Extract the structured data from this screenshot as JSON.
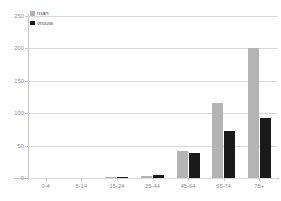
{
  "legend": {
    "position": "top-left",
    "entries": [
      {
        "label": "man",
        "color": "#b4b4b4"
      },
      {
        "label": "vrouw",
        "color": "#1a1a1a"
      }
    ]
  },
  "axes": {
    "y_ticks": [
      "0",
      "50",
      "100",
      "150",
      "200",
      "250"
    ],
    "x_ticks": [
      "0-4",
      "5-14",
      "15-24",
      "25-44",
      "45-64",
      "65-74",
      "75+"
    ]
  },
  "chart_data": {
    "type": "bar",
    "title": "",
    "subtitle": "",
    "xlabel": "",
    "ylabel": "",
    "categories": [
      "0-4",
      "5-14",
      "15-24",
      "25-44",
      "45-64",
      "65-74",
      "75+"
    ],
    "series": [
      {
        "name": "man",
        "color": "#b4b4b4",
        "values": [
          0,
          0,
          1,
          3,
          42,
          115,
          200
        ]
      },
      {
        "name": "vrouw",
        "color": "#1a1a1a",
        "values": [
          0,
          0,
          1,
          5,
          38,
          73,
          92
        ]
      }
    ],
    "ylim": [
      0,
      250
    ],
    "ytick_values": [
      0,
      50,
      100,
      150,
      200,
      250
    ],
    "grid": {
      "horizontal": true,
      "vertical": false,
      "color": "#d9d9d9"
    },
    "legend_position": "top-left",
    "bar_mode": "grouped"
  }
}
